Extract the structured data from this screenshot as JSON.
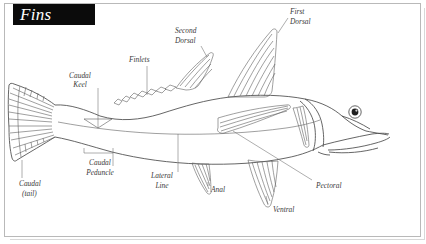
{
  "page": {
    "title": "Fins",
    "domain_kind": "anatomical-diagram"
  },
  "frame": {
    "border_color": "#b9b9b9",
    "background": "#ffffff"
  },
  "banner": {
    "label": "Fins",
    "background": "#0b0b0b",
    "text_color": "#ffffff"
  },
  "labels": [
    {
      "id": "caudal-keel",
      "line1": "Caudal",
      "line2": "Keel",
      "x": 80,
      "y": 78
    },
    {
      "id": "finlets",
      "line1": "Finlets",
      "line2": "",
      "x": 129,
      "y": 62
    },
    {
      "id": "second-dorsal",
      "line1": "Second",
      "line2": "Dorsal",
      "x": 175,
      "y": 33
    },
    {
      "id": "first-dorsal",
      "line1": "First",
      "line2": "Dorsal",
      "x": 290,
      "y": 13
    },
    {
      "id": "caudal-tail",
      "line1": "Caudal",
      "line2": "(tail)",
      "x": 19,
      "y": 185
    },
    {
      "id": "caudal-peduncle",
      "line1": "Caudal",
      "line2": "Peduncle",
      "x": 84,
      "y": 164
    },
    {
      "id": "lateral-line",
      "line1": "Lateral",
      "line2": "Line",
      "x": 147,
      "y": 177
    },
    {
      "id": "anal",
      "line1": "Anal",
      "line2": "",
      "x": 211,
      "y": 190
    },
    {
      "id": "ventral",
      "line1": "Ventral",
      "line2": "",
      "x": 273,
      "y": 208
    },
    {
      "id": "pectoral",
      "line1": "Pectoral",
      "line2": "",
      "x": 316,
      "y": 186
    }
  ],
  "colors": {
    "ink": "#4a4a4a",
    "label_text": "#3a3a3a",
    "leader_line": "#6b6b6b",
    "fin_line": "#5f5f5f",
    "frame": "#b9b9b9"
  }
}
